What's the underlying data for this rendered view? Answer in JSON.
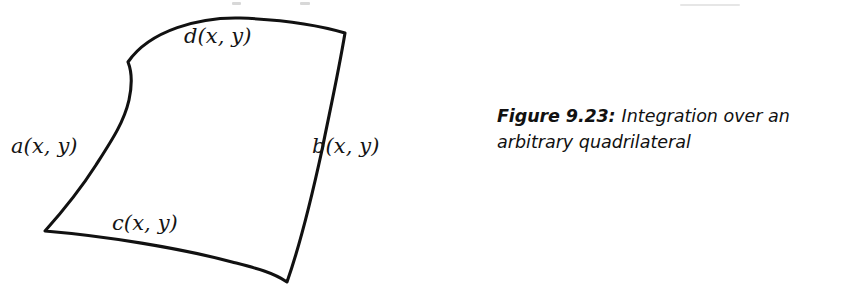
{
  "figure": {
    "alt_name": "arbitrary-quadrilateral-diagram",
    "stroke_color": "#111111",
    "fill_color": "#ffffff",
    "edge_labels": {
      "top": "d(x, y)",
      "left": "a(x, y)",
      "right": "b(x, y)",
      "bottom": "c(x, y)"
    },
    "vertices": {
      "top_left": [
        128,
        62
      ],
      "top_right": [
        345,
        33
      ],
      "bottom_right": [
        287,
        282
      ],
      "bottom_left": [
        45,
        231
      ]
    }
  },
  "caption": {
    "figure_number": "Figure 9.23:",
    "text": "Integration over an arbitrary quadrilateral"
  }
}
